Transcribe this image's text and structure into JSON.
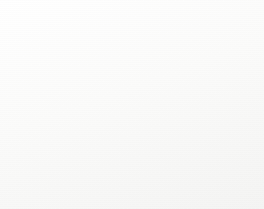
{
  "figure": {
    "frame_border_color": "#9a9a9a",
    "background": "#ffffff"
  },
  "chart_data": {
    "type": "pie",
    "title": "",
    "grid": false,
    "legend_position": "none",
    "categories": [
      "Download software, firm...",
      "Configure / set up a pr...",
      "Troubleshooting (bug fi...",
      "Other"
    ],
    "values": [
      43,
      15,
      6,
      36
    ],
    "data_labels": [
      "43",
      "15",
      "6"
    ],
    "colors": [
      "#c9c9c9",
      "#8f8f8f",
      "#b5b5b5",
      "#e3e3e3"
    ],
    "slice_outline_color": "#2b2b2b",
    "start_angle_deg": 0,
    "direction": "clockwise"
  },
  "labels": {
    "download": {
      "line1": "Download",
      "line2": "software,",
      "line3": "firm..."
    },
    "configure": {
      "line1": "Configure / set",
      "line2": "up a pr..."
    },
    "troubleshoot": {
      "line1": "Troubleshootin",
      "line2": "g (bug fi..."
    }
  },
  "callouts": {
    "top_left": "43",
    "bottom_left": "15",
    "bottom_right": "6"
  }
}
